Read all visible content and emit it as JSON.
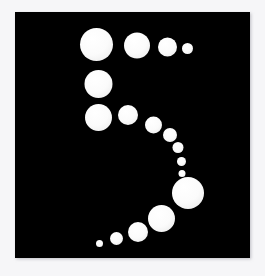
{
  "artwork": {
    "title": "Spiral of white dots on black square",
    "canvas": {
      "width": 265,
      "height": 276
    },
    "outer_background_color": "#f6f6f8",
    "plate": {
      "name": "black-square-plate",
      "x": 15,
      "y": 12,
      "width": 235,
      "height": 246,
      "fill_color": "#050505",
      "edge_shadow_color": "#d8d8dc"
    },
    "dot_color": "#fbfbfb",
    "dot_count": 17,
    "dots": [
      {
        "id": "dot-01",
        "cx": 96.5,
        "cy": 44.5,
        "r": 16.5
      },
      {
        "id": "dot-02",
        "cx": 137.0,
        "cy": 45.5,
        "r": 13.0
      },
      {
        "id": "dot-03",
        "cx": 167.5,
        "cy": 47.0,
        "r": 9.5
      },
      {
        "id": "dot-04",
        "cx": 187.5,
        "cy": 48.5,
        "r": 5.5
      },
      {
        "id": "dot-05",
        "cx": 98.5,
        "cy": 84.0,
        "r": 14.0
      },
      {
        "id": "dot-06",
        "cx": 98.5,
        "cy": 117.5,
        "r": 13.5
      },
      {
        "id": "dot-07",
        "cx": 128.0,
        "cy": 115.0,
        "r": 10.0
      },
      {
        "id": "dot-08",
        "cx": 153.5,
        "cy": 125.0,
        "r": 8.5
      },
      {
        "id": "dot-09",
        "cx": 170.0,
        "cy": 135.0,
        "r": 7.0
      },
      {
        "id": "dot-10",
        "cx": 178.0,
        "cy": 147.5,
        "r": 5.5
      },
      {
        "id": "dot-11",
        "cx": 181.5,
        "cy": 161.5,
        "r": 4.5
      },
      {
        "id": "dot-12",
        "cx": 182.0,
        "cy": 173.5,
        "r": 3.5
      },
      {
        "id": "dot-13",
        "cx": 188.0,
        "cy": 193.0,
        "r": 16.0
      },
      {
        "id": "dot-14",
        "cx": 161.5,
        "cy": 218.5,
        "r": 13.5
      },
      {
        "id": "dot-15",
        "cx": 138.0,
        "cy": 232.0,
        "r": 10.0
      },
      {
        "id": "dot-16",
        "cx": 116.5,
        "cy": 238.5,
        "r": 6.5
      },
      {
        "id": "dot-17",
        "cx": 99.5,
        "cy": 243.5,
        "r": 3.5
      }
    ]
  }
}
